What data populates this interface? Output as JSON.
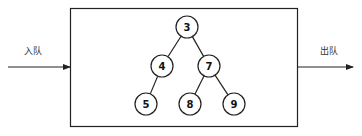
{
  "labels": {
    "enqueue": "入队",
    "dequeue": "出队"
  },
  "tree": {
    "nodes": [
      {
        "id": "n3",
        "value": "3"
      },
      {
        "id": "n4",
        "value": "4"
      },
      {
        "id": "n7",
        "value": "7"
      },
      {
        "id": "n5",
        "value": "5"
      },
      {
        "id": "n8",
        "value": "8"
      },
      {
        "id": "n9",
        "value": "9"
      }
    ],
    "edges": [
      [
        "n3",
        "n4"
      ],
      [
        "n3",
        "n7"
      ],
      [
        "n4",
        "n5"
      ],
      [
        "n7",
        "n8"
      ],
      [
        "n7",
        "n9"
      ]
    ]
  },
  "colors": {
    "stroke": "#222222",
    "background": "#ffffff"
  }
}
